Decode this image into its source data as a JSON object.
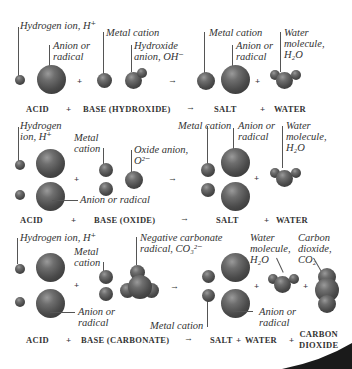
{
  "diagram": {
    "rows": [
      {
        "labels": {
          "hydrogen": "Hydrogen ion, H⁺",
          "anion": [
            "Anion or",
            "radical"
          ],
          "metal": "Metal cation",
          "hydroxide": [
            "Hydroxide",
            "anion, OH⁻"
          ],
          "salt_metal": "Metal cation",
          "salt_anion": [
            "Anion or",
            "radical"
          ],
          "water": [
            "Water",
            "molecule,",
            "H₂O"
          ]
        },
        "equation": {
          "acid": "ACID",
          "plus1": "+",
          "base": "BASE (HYDROXIDE)",
          "arrow": "→",
          "salt": "SALT",
          "plus2": "+",
          "water": "WATER"
        }
      },
      {
        "labels": {
          "hydrogen": [
            "Hydrogen",
            "ion, H⁺"
          ],
          "metal": [
            "Metal",
            "cation"
          ],
          "oxide": [
            "Oxide anion,",
            "O²⁻"
          ],
          "anion": "Anion or radical",
          "salt_metal": "Metal cation",
          "salt_anion": [
            "Anion or",
            "radical"
          ],
          "water": [
            "Water",
            "molecule,",
            "H₂O"
          ]
        },
        "equation": {
          "acid": "ACID",
          "plus1": "+",
          "base": "BASE (OXIDE)",
          "arrow": "→",
          "salt": "SALT",
          "plus2": "+",
          "water": "WATER"
        }
      },
      {
        "labels": {
          "hydrogen": "Hydrogen ion, H⁺",
          "metal": [
            "Metal",
            "cation"
          ],
          "carbonate": [
            "Negative carbonate",
            "radical, CO₃²⁻"
          ],
          "anion": [
            "Anion or",
            "radical"
          ],
          "water": [
            "Water",
            "molecule,",
            "H₂O"
          ],
          "co2": [
            "Carbon",
            "dioxide,",
            "CO₂"
          ],
          "salt_metal": "Metal cation",
          "salt_anion": [
            "Anion or",
            "radical"
          ]
        },
        "equation": {
          "acid": "ACID",
          "plus1": "+",
          "base": "BASE (CARBONATE)",
          "arrow": "→",
          "salt": "SALT",
          "plus2": "+",
          "water": "WATER",
          "plus3": "+",
          "co2": [
            "CARBON",
            "DIOXIDE"
          ]
        }
      }
    ]
  }
}
